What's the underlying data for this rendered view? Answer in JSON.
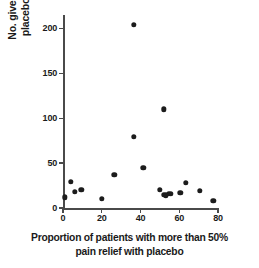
{
  "chart_data": {
    "type": "scatter",
    "title": "",
    "subtitle": "",
    "xlabel_line1": "Proportion of patients with more than 50%",
    "xlabel_line2": "pain relief with placebo",
    "ylabel_line1": "No. given",
    "ylabel_line2": "placebo",
    "xlim": [
      0,
      80
    ],
    "ylim": [
      0,
      215
    ],
    "xticks": [
      0,
      20,
      40,
      60,
      80
    ],
    "yticks": [
      0,
      50,
      100,
      150,
      200
    ],
    "xtick_labels": [
      "0",
      "20",
      "40",
      "60",
      "80"
    ],
    "ytick_labels": [
      "0",
      "50",
      "100",
      "150",
      "200"
    ],
    "grid": false,
    "legend": null,
    "marker": "filled-circle",
    "marker_color": "#1c1c1c",
    "axis_color": "#4a4a4a",
    "points": [
      {
        "x": 1.0,
        "y": 12
      },
      {
        "x": 4.0,
        "y": 29
      },
      {
        "x": 6.0,
        "y": 18
      },
      {
        "x": 9.5,
        "y": 20
      },
      {
        "x": 20.0,
        "y": 10
      },
      {
        "x": 26.5,
        "y": 37
      },
      {
        "x": 36.5,
        "y": 204
      },
      {
        "x": 36.5,
        "y": 79
      },
      {
        "x": 41.5,
        "y": 45
      },
      {
        "x": 50.0,
        "y": 20
      },
      {
        "x": 52.0,
        "y": 15
      },
      {
        "x": 53.0,
        "y": 14
      },
      {
        "x": 54.5,
        "y": 16
      },
      {
        "x": 55.5,
        "y": 16
      },
      {
        "x": 52.0,
        "y": 110
      },
      {
        "x": 60.5,
        "y": 17
      },
      {
        "x": 63.5,
        "y": 28
      },
      {
        "x": 70.5,
        "y": 19
      },
      {
        "x": 77.5,
        "y": 8
      }
    ]
  }
}
